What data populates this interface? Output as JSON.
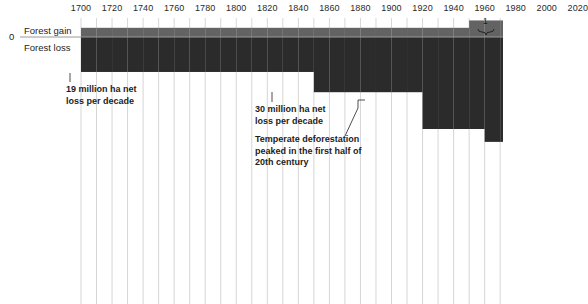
{
  "chart_data": {
    "type": "bar",
    "title": "",
    "subtitle": "",
    "xlabel": "",
    "ylabel": "",
    "orientation": "vertical-diverging",
    "grid": true,
    "legend_position": "inline-left",
    "xlim": [
      1690,
      2030
    ],
    "xticks": [
      1700,
      1720,
      1740,
      1760,
      1780,
      1800,
      1820,
      1840,
      1860,
      1880,
      1900,
      1920,
      1940,
      1960,
      1980,
      2000,
      2020
    ],
    "xtick_labels": [
      "1700",
      "1720",
      "1740",
      "1760",
      "1780",
      "1800",
      "1820",
      "1840",
      "1860",
      "1880",
      "1900",
      "1920",
      "1940",
      "1960",
      "1980",
      "2000",
      "2020"
    ],
    "zero_tick_label": "0",
    "series": [
      {
        "name": "Forest gain",
        "color": "#636363",
        "direction": "up",
        "unit": "million ha per decade",
        "x": [
          1700,
          1710,
          1720,
          1730,
          1740,
          1750,
          1760,
          1770,
          1780,
          1790,
          1800,
          1810,
          1820,
          1830,
          1840,
          1850,
          1860,
          1870,
          1880,
          1890,
          1900,
          1910,
          1920,
          1930,
          1940,
          1950,
          1960,
          1970,
          1980,
          1990,
          2000,
          2010
        ],
        "values": [
          5,
          5,
          5,
          5,
          5,
          5,
          5,
          5,
          5,
          5,
          5,
          5,
          5,
          5,
          5,
          5,
          5,
          5,
          5,
          5,
          5,
          5,
          5,
          5,
          5,
          9,
          9,
          9,
          9,
          12,
          18,
          18
        ]
      },
      {
        "name": "Forest loss",
        "color": "#2b2b2b",
        "direction": "down",
        "unit": "million ha per decade",
        "x": [
          1700,
          1710,
          1720,
          1730,
          1740,
          1750,
          1760,
          1770,
          1780,
          1790,
          1800,
          1810,
          1820,
          1830,
          1840,
          1850,
          1860,
          1870,
          1880,
          1890,
          1900,
          1910,
          1920,
          1930,
          1940,
          1950,
          1960,
          1970,
          1980,
          1990,
          2000,
          2010
        ],
        "values": [
          19,
          19,
          19,
          19,
          19,
          19,
          19,
          19,
          19,
          19,
          19,
          19,
          19,
          19,
          19,
          30,
          30,
          30,
          30,
          30,
          30,
          30,
          50,
          50,
          50,
          50,
          57,
          57,
          57,
          57,
          57,
          91
        ]
      }
    ],
    "annotations": [
      {
        "id": "early-loss",
        "text": "19 million ha net\nloss per decade",
        "x_year": 1705,
        "value": -19
      },
      {
        "id": "mid-loss",
        "text": "30 million ha net\nloss per decade",
        "x_year": 1852,
        "value": -30
      },
      {
        "id": "temperate-peak",
        "text": "Temperate deforestation\npeaked in the first half of\n20th century",
        "x_year": 1925,
        "value": -50
      }
    ],
    "footnotes": [
      {
        "marker": "1",
        "x_year": 2015,
        "note": "bracket over final decade"
      }
    ]
  },
  "axis": {
    "zero_label": "0",
    "gain_label": "Forest gain",
    "loss_label": "Forest loss"
  },
  "colors": {
    "gain": "#636363",
    "loss": "#2b2b2b",
    "gridline": "#d6d6d6",
    "zero_axis": "#9a9a9a",
    "background": "#ffffff",
    "text": "#1d1d1d"
  }
}
